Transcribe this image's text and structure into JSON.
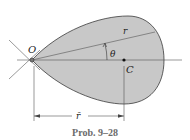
{
  "figure": {
    "caption": "Prob. 9–28",
    "labels": {
      "origin": "O",
      "centroid": "C",
      "radius": "r",
      "angle": "θ",
      "rbar": "r̄"
    },
    "colors": {
      "fill": "#c8c8c8",
      "outline": "#3a3a3a",
      "lines": "#555555",
      "caption": "#6b6b6b"
    }
  }
}
